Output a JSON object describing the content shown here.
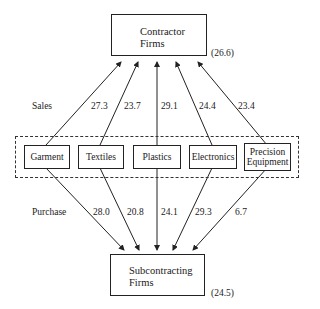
{
  "top_node": {
    "line1": "Contractor",
    "line2": "Firms",
    "value": "(26.6)"
  },
  "bottom_node": {
    "line1": "Subcontracting",
    "line2": "Firms",
    "value": "(24.5)"
  },
  "row_labels": {
    "sales": "Sales",
    "purchase": "Purchase"
  },
  "industries": [
    {
      "name": "Garment",
      "sales": "27.3",
      "purchase": "28.0"
    },
    {
      "name": "Textiles",
      "sales": "23.7",
      "purchase": "20.8"
    },
    {
      "name": "Plastics",
      "sales": "29.1",
      "purchase": "24.1"
    },
    {
      "name": "Electronics",
      "sales": "24.4",
      "purchase": "29.3"
    },
    {
      "name_line1": "Precision",
      "name_line2": "Equipment",
      "sales": "23.4",
      "purchase": "6.7"
    }
  ]
}
